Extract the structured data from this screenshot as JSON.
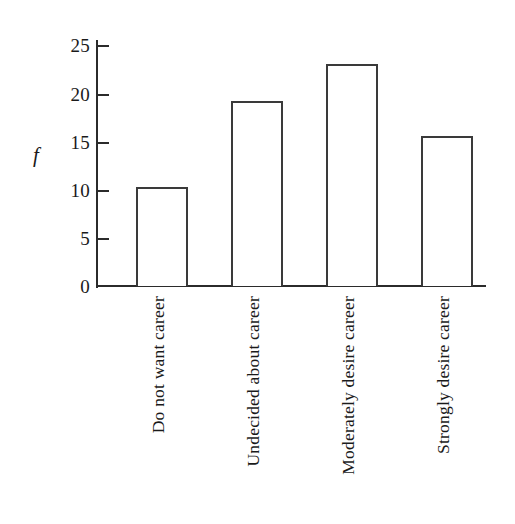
{
  "chart_data": {
    "type": "bar",
    "title": "",
    "subtitle": "",
    "xlabel": "",
    "ylabel": "f",
    "categories": [
      "Do not want career",
      "Undecided about career",
      "Moderately desire career",
      "Strongly desire career"
    ],
    "values": [
      10.3,
      19.3,
      23.1,
      15.6
    ],
    "ylim": [
      0,
      26
    ],
    "yticks": [
      0,
      5,
      10,
      15,
      20,
      25
    ],
    "ytick_labels": [
      "0",
      "5",
      "10",
      "15",
      "20",
      "25"
    ],
    "grid": false,
    "legend": null,
    "bar_fill_color": "#ffffff",
    "bar_edge_color": "#3a3a3a",
    "axis_color": "#2b2b2b",
    "background_color": "#ffffff"
  },
  "figure": {
    "name": "frequency-bar-chart",
    "axis_label_y": "f"
  }
}
